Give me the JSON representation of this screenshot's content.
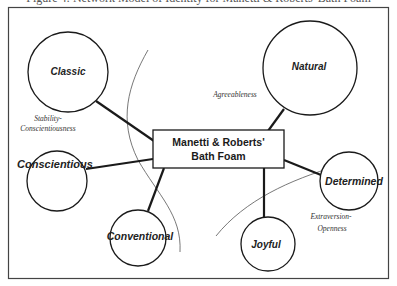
{
  "caption": "Figure 4: Network Model of Identity for Manetti & Roberts' Bath Foam",
  "center": {
    "line1": "Manetti & Roberts'",
    "line2": "Bath Foam"
  },
  "nodes": {
    "classic": "Classic",
    "natural": "Natural",
    "conscientious": "Conscientious",
    "determined": "Determined",
    "conventional": "Conventional",
    "joyful": "Joyful"
  },
  "dimensions": {
    "stability_line1": "Stability-",
    "stability_line2": "Conscientiousness",
    "agreeableness": "Agreeableness",
    "extraversion_line1": "Extraversion-",
    "extraversion_line2": "Openness"
  },
  "colors": {
    "stroke": "#1a1a1a",
    "frame": "#444444",
    "divider": "#555555",
    "background": "#ffffff"
  }
}
